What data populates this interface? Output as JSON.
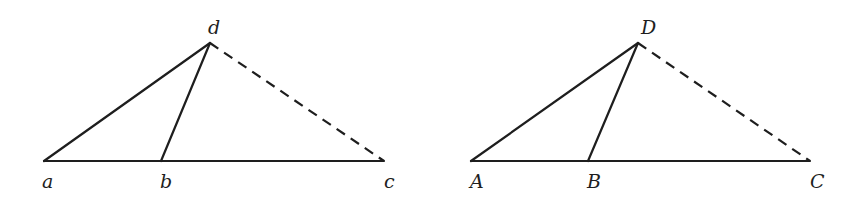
{
  "figure": {
    "colors": {
      "stroke": "#1e1e1e",
      "background": "#ffffff"
    },
    "triangles": [
      {
        "id": "left",
        "vertices": {
          "a": {
            "label": "a",
            "x": 44,
            "y": 161,
            "lx": 42,
            "ly": 188
          },
          "b": {
            "label": "b",
            "x": 161,
            "y": 161,
            "lx": 160,
            "ly": 188
          },
          "c": {
            "label": "c",
            "x": 384,
            "y": 161,
            "lx": 384,
            "ly": 188
          },
          "d": {
            "label": "d",
            "x": 210,
            "y": 43,
            "lx": 208,
            "ly": 34
          }
        },
        "edges": [
          {
            "from": "a",
            "to": "c",
            "style": "solid"
          },
          {
            "from": "a",
            "to": "d",
            "style": "solid"
          },
          {
            "from": "b",
            "to": "d",
            "style": "solid"
          },
          {
            "from": "d",
            "to": "c",
            "style": "dashed"
          }
        ]
      },
      {
        "id": "right",
        "vertices": {
          "A": {
            "label": "A",
            "x": 471,
            "y": 161,
            "lx": 470,
            "ly": 188
          },
          "B": {
            "label": "B",
            "x": 588,
            "y": 161,
            "lx": 587,
            "ly": 188
          },
          "C": {
            "label": "C",
            "x": 810,
            "y": 161,
            "lx": 810,
            "ly": 188
          },
          "D": {
            "label": "D",
            "x": 638,
            "y": 43,
            "lx": 641,
            "ly": 34
          }
        },
        "edges": [
          {
            "from": "A",
            "to": "C",
            "style": "solid"
          },
          {
            "from": "A",
            "to": "D",
            "style": "solid"
          },
          {
            "from": "B",
            "to": "D",
            "style": "solid"
          },
          {
            "from": "D",
            "to": "C",
            "style": "dashed"
          }
        ]
      }
    ]
  }
}
